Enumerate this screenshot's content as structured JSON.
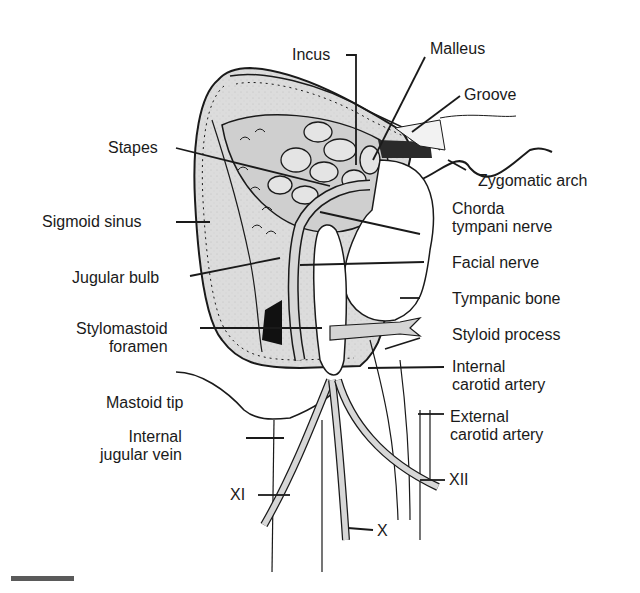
{
  "figure": {
    "type": "anatomical illustration",
    "fill_color": "#d9d9d9",
    "line_color": "#1a1a1a"
  },
  "labels": {
    "incus": "Incus",
    "malleus": "Malleus",
    "groove": "Groove",
    "stapes": "Stapes",
    "zygomatic_arch": "Zygomatic arch",
    "chorda_tympani_1": "Chorda",
    "chorda_tympani_2": "tympani nerve",
    "sigmoid_sinus": "Sigmoid sinus",
    "facial_nerve": "Facial nerve",
    "jugular_bulb": "Jugular bulb",
    "tympanic_bone": "Tympanic bone",
    "stylomastoid_1": "Stylomastoid",
    "stylomastoid_2": "foramen",
    "styloid_process": "Styloid process",
    "internal_carotid_1": "Internal",
    "internal_carotid_2": "carotid artery",
    "mastoid_tip": "Mastoid tip",
    "external_carotid_1": "External",
    "external_carotid_2": "carotid artery",
    "internal_jugular_1": "Internal",
    "internal_jugular_2": "jugular vein",
    "nerve_xi": "XI",
    "nerve_xii": "XII",
    "nerve_x": "X"
  },
  "scale_bar": {
    "visible": true
  }
}
